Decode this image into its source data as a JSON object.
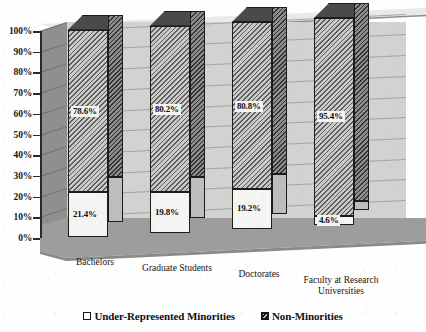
{
  "chart_data": {
    "type": "bar",
    "subtype": "stacked-column-3d",
    "title": "",
    "xlabel": "",
    "ylabel": "",
    "ylim": [
      0,
      100
    ],
    "ytick_labels": [
      "100%",
      "90%",
      "80%",
      "70%",
      "60%",
      "50%",
      "40%",
      "30%",
      "20%",
      "10%",
      "0%"
    ],
    "ytick_values": [
      100,
      90,
      80,
      70,
      60,
      50,
      40,
      30,
      20,
      10,
      0
    ],
    "grid": true,
    "legend_position": "bottom",
    "categories": [
      "Bachelors",
      "Graduate Students",
      "Doctorates",
      "Faculty at Research Universities"
    ],
    "series": [
      {
        "name": "Under-Represented Minorities",
        "values": [
          21.4,
          19.8,
          19.2,
          4.6
        ],
        "labels": [
          "21.4%",
          "19.8%",
          "19.2%",
          "4.6%"
        ],
        "swatch": "open-square"
      },
      {
        "name": "Non-Minorities",
        "values": [
          78.6,
          80.2,
          80.8,
          95.4
        ],
        "labels": [
          "78.6%",
          "80.2%",
          "80.8%",
          "95.4%"
        ],
        "swatch": "hatched-square"
      }
    ]
  },
  "category_lines": [
    [
      "Bachelors"
    ],
    [
      "Graduate Students"
    ],
    [
      "Doctorates"
    ],
    [
      "Faculty at Research",
      "Universities"
    ]
  ],
  "legend": {
    "items": [
      {
        "label": "Under-Represented Minorities"
      },
      {
        "label": "Non-Minorities"
      }
    ]
  },
  "colors": {
    "back_wall": "#d2d2d0",
    "left_wall": "#8f8f8d",
    "floor": "#9d9d9b",
    "bar_outline": "#1c1c1c",
    "hatch_fill": "#c9c9c7",
    "plain_fill": "#f4f4f2",
    "text": "#141414"
  }
}
